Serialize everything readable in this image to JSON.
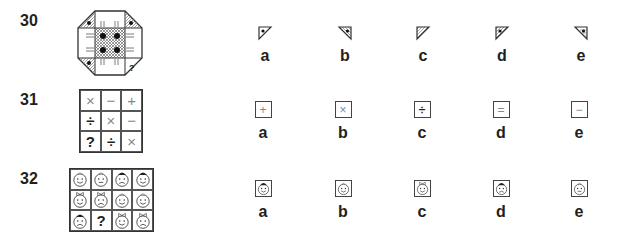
{
  "questions": [
    {
      "number": "30",
      "puzzle": {
        "type": "octagon-tile",
        "description": "Octagon with central cross-hatched square containing four dots; corner triangles with dots; bottom-right corner missing",
        "missing_marker": "?"
      },
      "options": [
        {
          "label": "a",
          "figure": "triangle-top-left-dot"
        },
        {
          "label": "b",
          "figure": "triangle-top-right-hatched-dot"
        },
        {
          "label": "c",
          "figure": "triangle-top-left-hatched"
        },
        {
          "label": "d",
          "figure": "triangle-top-left-hatched-dot"
        },
        {
          "label": "e",
          "figure": "triangle-top-right-lined-dot"
        }
      ]
    },
    {
      "number": "31",
      "puzzle": {
        "type": "grid-3x3",
        "cells": [
          "×",
          "−",
          "+",
          "÷",
          "×",
          "−",
          "?",
          "÷",
          "×"
        ]
      },
      "options": [
        {
          "label": "a",
          "symbol": "+"
        },
        {
          "label": "b",
          "symbol": "×"
        },
        {
          "label": "c",
          "symbol": "÷"
        },
        {
          "label": "d",
          "symbol": "="
        },
        {
          "label": "e",
          "symbol": "−"
        }
      ]
    },
    {
      "number": "32",
      "puzzle": {
        "type": "grid-4x3",
        "cells": [
          "smile",
          "neutral",
          "hat-frown",
          "hat-smile",
          "bow-smile",
          "bow-frown",
          "smile",
          "smile",
          "hat-frown",
          "?",
          "bow-smile",
          "bow-frown"
        ]
      },
      "options": [
        {
          "label": "a",
          "face": "hat-smile"
        },
        {
          "label": "b",
          "face": "smile"
        },
        {
          "label": "c",
          "face": "bow-smile"
        },
        {
          "label": "d",
          "face": "hat-frown"
        },
        {
          "label": "e",
          "face": "neutral"
        }
      ]
    }
  ]
}
